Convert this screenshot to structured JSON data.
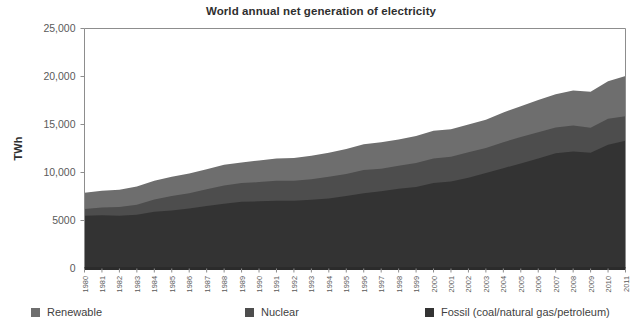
{
  "chart_data": {
    "type": "area",
    "title": "World annual net generation of electricity",
    "xlabel": "",
    "ylabel": "TWh",
    "ylim": [
      0,
      25000
    ],
    "xlim": [
      1980,
      2011
    ],
    "grid": false,
    "stacked": true,
    "legend_position": "bottom",
    "ytick_labels": [
      "25,000",
      "20,000",
      "15,000",
      "10,000",
      "5000",
      "0"
    ],
    "ytick_values": [
      25000,
      20000,
      15000,
      10000,
      5000,
      0
    ],
    "categories": [
      "1980",
      "1981",
      "1982",
      "1983",
      "1984",
      "1985",
      "1986",
      "1987",
      "1988",
      "1989",
      "1990",
      "1991",
      "1992",
      "1993",
      "1994",
      "1995",
      "1996",
      "1997",
      "1998",
      "1999",
      "2000",
      "2001",
      "2002",
      "2003",
      "2004",
      "2005",
      "2006",
      "2007",
      "2008",
      "2009",
      "2010",
      "2011"
    ],
    "series": [
      {
        "name": "Fossil (coal/natural gas/petroleum)",
        "color": "#333333",
        "values": [
          5500,
          5550,
          5500,
          5600,
          5900,
          6050,
          6250,
          6500,
          6750,
          6950,
          7000,
          7050,
          7050,
          7150,
          7300,
          7550,
          7850,
          8050,
          8300,
          8500,
          8900,
          9050,
          9450,
          9950,
          10450,
          10950,
          11450,
          12000,
          12200,
          12050,
          12900,
          13300
        ]
      },
      {
        "name": "Nuclear",
        "color": "#4d4d4d",
        "values": [
          700,
          800,
          900,
          1050,
          1300,
          1500,
          1600,
          1750,
          1900,
          1950,
          2000,
          2100,
          2100,
          2150,
          2250,
          2300,
          2400,
          2350,
          2400,
          2500,
          2550,
          2600,
          2650,
          2600,
          2700,
          2750,
          2750,
          2700,
          2700,
          2600,
          2700,
          2550
        ]
      },
      {
        "name": "Renewable",
        "color": "#6e6e6e",
        "values": [
          1700,
          1750,
          1800,
          1900,
          1950,
          2000,
          2050,
          2100,
          2150,
          2150,
          2250,
          2300,
          2350,
          2450,
          2500,
          2600,
          2700,
          2750,
          2750,
          2800,
          2900,
          2850,
          2900,
          2950,
          3100,
          3200,
          3350,
          3450,
          3650,
          3750,
          3900,
          4200
        ]
      }
    ],
    "totals": [
      7900,
      8100,
      8200,
      8550,
      9150,
      9550,
      9900,
      10350,
      10800,
      11050,
      11250,
      11450,
      11500,
      11750,
      12050,
      12450,
      12950,
      13150,
      13450,
      13800,
      14350,
      14500,
      15000,
      15500,
      16250,
      16900,
      17550,
      18150,
      18550,
      18400,
      19500,
      20050
    ]
  },
  "legend": {
    "items": [
      {
        "label": "Renewable",
        "color": "#6e6e6e"
      },
      {
        "label": "Nuclear",
        "color": "#4d4d4d"
      },
      {
        "label": "Fossil (coal/natural gas/petroleum)",
        "color": "#333333"
      }
    ]
  },
  "axis": {
    "y_title": "TWh"
  }
}
